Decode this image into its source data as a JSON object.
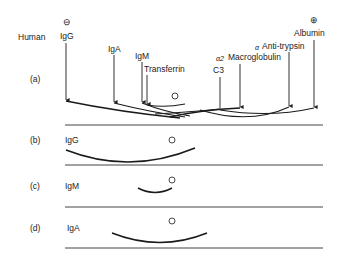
{
  "diagram": {
    "species_label": "Human",
    "cathode_symbol": "⊖",
    "anode_symbol": "⊕",
    "panels": [
      {
        "id": "a",
        "label": "(a)",
        "proteins": [
          {
            "name": "IgG"
          },
          {
            "name": "IgA"
          },
          {
            "name": "IgM"
          },
          {
            "name": "Transferrin"
          },
          {
            "name": "C3"
          },
          {
            "prefix": "α2",
            "name": "Macroglobulin"
          },
          {
            "prefix": "α",
            "name": "Anti-trypsin"
          },
          {
            "name": "Albumin"
          }
        ]
      },
      {
        "id": "b",
        "label": "(b)",
        "antiserum": "IgG"
      },
      {
        "id": "c",
        "label": "(c)",
        "antiserum": "IgM"
      },
      {
        "id": "d",
        "label": "(d)",
        "antiserum": "IgA"
      }
    ]
  }
}
